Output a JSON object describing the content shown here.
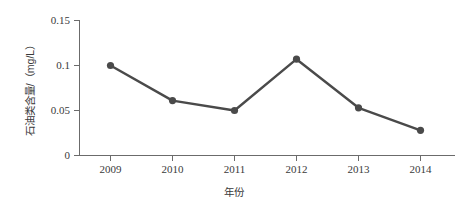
{
  "chart_data": {
    "type": "line",
    "title": "",
    "xlabel": "年份",
    "ylabel": "石油类含量/（mg/L）",
    "categories": [
      "2009",
      "2010",
      "2011",
      "2012",
      "2013",
      "2014"
    ],
    "values": [
      0.1,
      0.061,
      0.05,
      0.107,
      0.053,
      0.028
    ],
    "series": [
      {
        "name": "石油类含量",
        "values": [
          0.1,
          0.061,
          0.05,
          0.107,
          0.053,
          0.028
        ]
      }
    ],
    "ylim": [
      0,
      0.15
    ],
    "yticks": [
      "0",
      "0.05",
      "0.1",
      "0.15"
    ],
    "ytick_values": [
      0,
      0.05,
      0.1,
      0.15
    ],
    "xticks": [
      "2009",
      "2010",
      "2011",
      "2012",
      "2013",
      "2014"
    ],
    "grid": false,
    "legend": "none",
    "line_color": "#4a4a4a",
    "marker_color": "#4a4a4a",
    "marker": "circle"
  },
  "axes": {
    "y_tick_0": "0",
    "y_tick_1": "0.05",
    "y_tick_2": "0.1",
    "y_tick_3": "0.15",
    "x_tick_0": "2009",
    "x_tick_1": "2010",
    "x_tick_2": "2011",
    "x_tick_3": "2012",
    "x_tick_4": "2013",
    "x_tick_5": "2014",
    "x_axis_title": "年份",
    "y_axis_title": "石油类含量/（mg/L）"
  }
}
